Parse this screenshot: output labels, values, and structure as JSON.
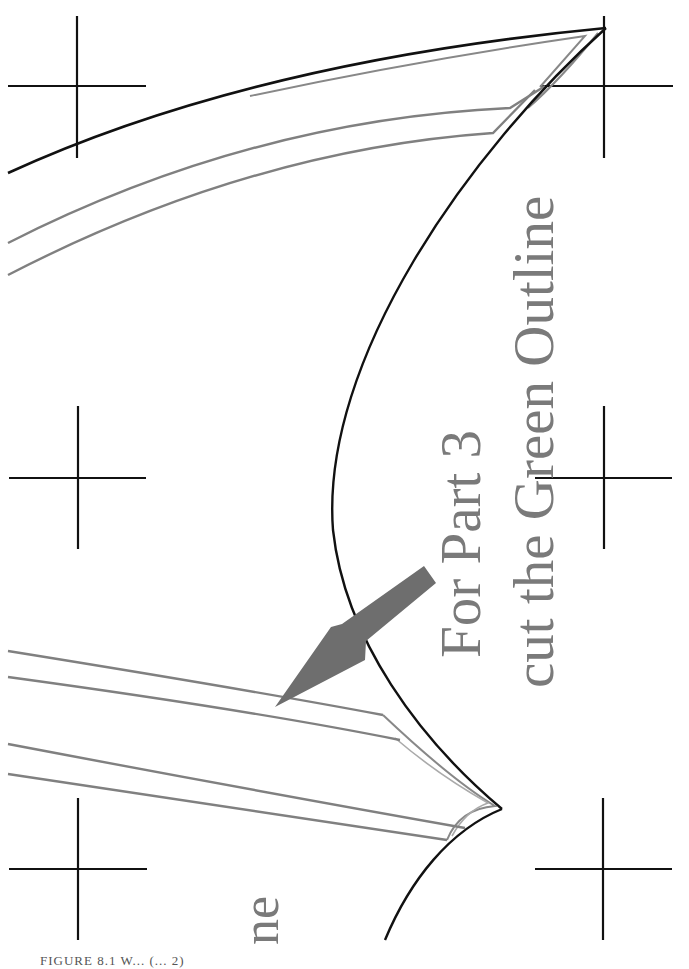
{
  "page": {
    "type": "sewing pattern sheet",
    "background": "#ffffff"
  },
  "instruction": {
    "line1": "For Part 3",
    "line2": "cut the Green Outline",
    "color": "#7a7a7a"
  },
  "partial_label": {
    "text": "ne",
    "note": "tail of a rotated label continued from a previous sheet"
  },
  "caption": {
    "text": "FIGURE 8.1   W...   (... 2)",
    "visibility": "clipped at bottom edge"
  },
  "colors": {
    "cut_line": "#111111",
    "seam_line": "#808080",
    "arrow": "#6e6e6e",
    "registration": "#111111"
  },
  "registration_marks": [
    {
      "id": "top-left",
      "cx": 77,
      "cy": 86
    },
    {
      "id": "top-right",
      "cx": 603,
      "cy": 86
    },
    {
      "id": "middle-left",
      "cx": 77,
      "cy": 477
    },
    {
      "id": "middle-right",
      "cx": 603,
      "cy": 477
    },
    {
      "id": "bottom-left",
      "cx": 77,
      "cy": 868
    },
    {
      "id": "bottom-right",
      "cx": 603,
      "cy": 868
    }
  ]
}
